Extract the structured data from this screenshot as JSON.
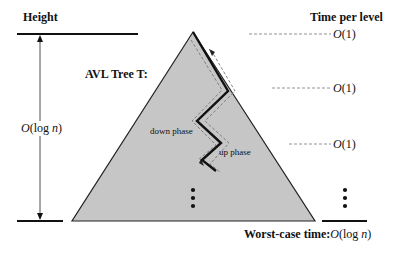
{
  "labels": {
    "height": "Height",
    "time_per_level": "Time per level",
    "tree_title": "AVL Tree T:",
    "height_bound": "O(log n)",
    "down_phase": "down phase",
    "up_phase": "up phase",
    "worst_case_label": "Worst-case time:",
    "worst_case_value": "O(log n)"
  },
  "time_per_level_entries": [
    "O(1)",
    "O(1)",
    "O(1)"
  ],
  "ellipsis_marks": [
    "⋮",
    "⋮"
  ],
  "colors": {
    "triangle_fill": "#c6c6c6",
    "line": "#111111",
    "dashed": "#777777",
    "background": "#ffffff"
  }
}
